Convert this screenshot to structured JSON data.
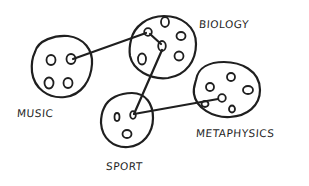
{
  "diagram": {
    "type": "hand-drawn concept map",
    "stroke_color": "#1f1f1f",
    "background": "#ffffff",
    "clusters": [
      {
        "id": "music",
        "label": "MUSIC",
        "dots": 4
      },
      {
        "id": "biology",
        "label": "BIOLOGY",
        "dots": 6
      },
      {
        "id": "sport",
        "label": "SPORT",
        "dots": 3
      },
      {
        "id": "metaphysics",
        "label": "METAPHYSICS",
        "dots": 6
      }
    ],
    "links": [
      {
        "from": "music",
        "to": "biology"
      },
      {
        "from": "biology",
        "to": "biology",
        "note": "internal link between two dots"
      },
      {
        "from": "biology",
        "to": "sport"
      },
      {
        "from": "sport",
        "to": "metaphysics"
      }
    ]
  }
}
